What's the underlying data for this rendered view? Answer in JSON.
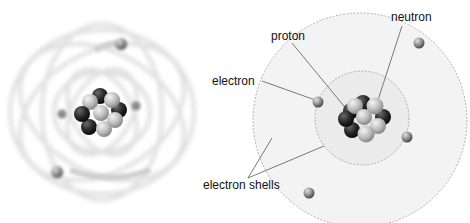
{
  "labels": {
    "neutron": "neutron",
    "proton": "proton",
    "electron": "electron",
    "electron_shells": "electron shells"
  },
  "colors": {
    "proton": "#2a2a2a",
    "neutron": "#bdbdbd",
    "electron": "#8a8a8a",
    "shell_fill": "#f2f2f2",
    "shell_stroke": "#9a9a9a"
  },
  "left_model": {
    "description": "blurred orbital model of atom"
  },
  "right_model": {
    "description": "shell model of atom",
    "shells": 2,
    "electrons": 4
  }
}
